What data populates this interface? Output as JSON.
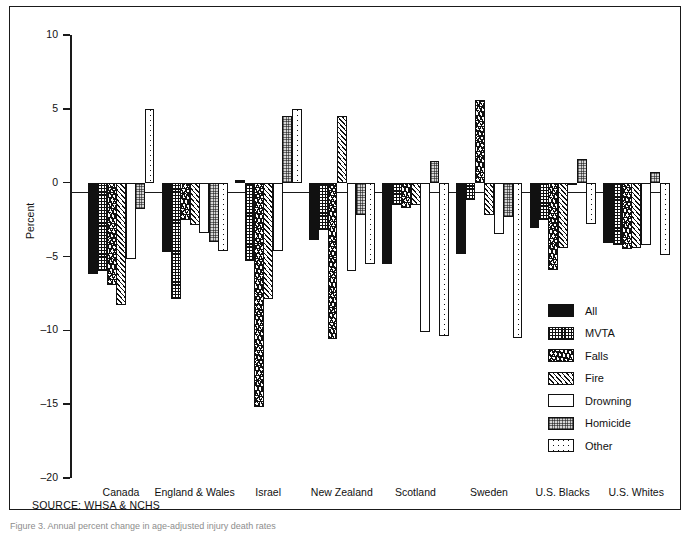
{
  "figure": {
    "source_note": "SOURCE: WHSA & NCHS",
    "caption": "Figure 3.  Annual percent change in age-adjusted injury death rates"
  },
  "chart_data": {
    "type": "bar",
    "title": "",
    "xlabel": "",
    "ylabel": "Percent",
    "ylim": [
      -20,
      10
    ],
    "yticks": [
      10,
      5,
      0,
      -5,
      -10,
      -15,
      -20
    ],
    "ytick_labels": [
      "10",
      "5",
      "0",
      "-5",
      "-10",
      "-15",
      "-20"
    ],
    "grid": false,
    "legend_position": "inside-right",
    "categories": [
      "Canada",
      "England & Wales",
      "Israel",
      "New Zealand",
      "Scotland",
      "Sweden",
      "U.S. Blacks",
      "U.S. Whites"
    ],
    "series": [
      {
        "name": "All",
        "pattern": "solid-black",
        "values": [
          -6.2,
          -4.7,
          0.2,
          -3.9,
          -5.5,
          -4.8,
          -3.1,
          -4.1
        ]
      },
      {
        "name": "MVTA",
        "pattern": "grid",
        "values": [
          -6.0,
          -7.9,
          -5.3,
          -3.2,
          -1.5,
          -1.2,
          -2.5,
          -4.2
        ]
      },
      {
        "name": "Falls",
        "pattern": "speckle-dark",
        "values": [
          -6.9,
          -2.5,
          -15.2,
          -10.6,
          -1.7,
          5.6,
          -5.9,
          -4.5
        ]
      },
      {
        "name": "Fire",
        "pattern": "diagonal",
        "values": [
          -8.3,
          -2.9,
          -7.9,
          4.5,
          -1.5,
          -2.2,
          -4.4,
          -4.4
        ]
      },
      {
        "name": "Drowning",
        "pattern": "white",
        "values": [
          -5.2,
          -3.4,
          -4.6,
          -6.0,
          -10.1,
          -3.5,
          -0.1,
          -4.2
        ]
      },
      {
        "name": "Homicide",
        "pattern": "gray-dot",
        "values": [
          -1.8,
          -4.0,
          4.5,
          -2.2,
          1.5,
          -2.3,
          1.6,
          0.7
        ]
      },
      {
        "name": "Other",
        "pattern": "light-speckle",
        "values": [
          5.0,
          -4.6,
          5.0,
          -5.5,
          -10.4,
          -10.5,
          -2.8,
          -4.9
        ]
      }
    ]
  },
  "legend": {
    "items": [
      {
        "label": "All"
      },
      {
        "label": "MVTA"
      },
      {
        "label": "Falls"
      },
      {
        "label": "Fire"
      },
      {
        "label": "Drowning"
      },
      {
        "label": "Homicide"
      },
      {
        "label": "Other"
      }
    ]
  }
}
